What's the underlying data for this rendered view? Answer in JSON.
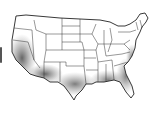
{
  "map": {
    "region": "United States (contiguous)",
    "style": "state outlines with gray shading",
    "shading_color": "#7a7a7a",
    "outline_color": "#222222",
    "background": "#ffffff",
    "shaded_regions": [
      "California",
      "Arizona",
      "New Mexico",
      "Texas",
      "Southeast",
      "Florida",
      "Atlantic coast"
    ]
  }
}
